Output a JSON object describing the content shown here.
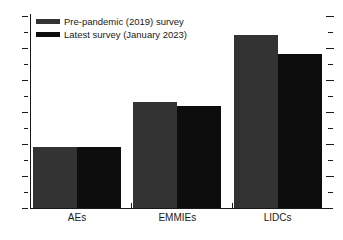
{
  "chart_data": {
    "type": "bar",
    "title": "",
    "subtitle": "",
    "xlabel": "",
    "ylabel": "",
    "categories": [
      "AEs",
      "EMMIEs",
      "LIDCs"
    ],
    "series": [
      {
        "name": "Pre-pandemic (2019) survey",
        "color": "#333333",
        "values": [
          1.9,
          3.3,
          5.4
        ]
      },
      {
        "name": "Latest survey (January 2023)",
        "color": "#0d0d0d",
        "values": [
          1.9,
          3.2,
          4.8
        ]
      }
    ],
    "ylim": [
      0,
      6
    ],
    "ytick_labels": [
      "0",
      "1",
      "2",
      "3",
      "4",
      "5",
      "6"
    ],
    "ytick_values": [
      0,
      1,
      2,
      3,
      4,
      5,
      6
    ],
    "yminor_values": [
      0.5,
      1.5,
      2.5,
      3.5,
      4.5,
      5.5
    ],
    "grid": false,
    "legend_position": "top-left",
    "right_axis_ticks": true,
    "right_axis_labels": false
  },
  "legend": {
    "items": [
      {
        "label": "Pre-pandemic (2019) survey",
        "color": "#333333"
      },
      {
        "label": "Latest survey (January 2023)",
        "color": "#0d0d0d"
      }
    ]
  },
  "axes": {
    "y": {
      "labels": [
        "6",
        "5",
        "4",
        "3",
        "2",
        "1",
        "0"
      ]
    },
    "x": {
      "labels": [
        "AEs",
        "EMMIEs",
        "LIDCs"
      ]
    }
  },
  "colors": {
    "series_1": "#333333",
    "series_2": "#0d0d0d",
    "axis": "#1a1a1a",
    "background": "#ffffff"
  }
}
